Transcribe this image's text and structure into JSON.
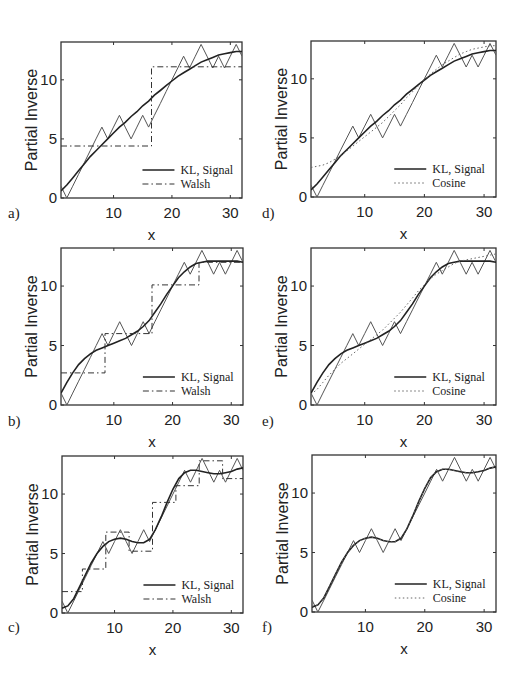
{
  "figure": {
    "y_axis_label": "Partial Inverse",
    "x_axis_label": "x",
    "x_ticks": [
      10,
      20,
      30
    ],
    "y_ticks": [
      0,
      5,
      10
    ]
  },
  "chart_data": [
    {
      "panel": "a)",
      "type": "line",
      "xlabel": "x",
      "ylabel": "Partial Inverse",
      "xlim": [
        1,
        32
      ],
      "ylim": [
        0,
        13.2
      ],
      "legend_position": "lower right",
      "legend": [
        "KL, Signal",
        "Walsh"
      ],
      "x": [
        1,
        2,
        3,
        4,
        5,
        6,
        7,
        8,
        9,
        10,
        11,
        12,
        13,
        14,
        15,
        16,
        17,
        18,
        19,
        20,
        21,
        22,
        23,
        24,
        25,
        26,
        27,
        28,
        29,
        30,
        31,
        32
      ],
      "series": [
        {
          "name": "Signal",
          "style": "solid-thin",
          "values": [
            1,
            0,
            1,
            2,
            3,
            4,
            5,
            6,
            5,
            6,
            7,
            6,
            5,
            6,
            7,
            6,
            7,
            8,
            9,
            10,
            11,
            12,
            11,
            12,
            13,
            12,
            11,
            12,
            11,
            12,
            13,
            12
          ]
        },
        {
          "name": "KL",
          "style": "solid",
          "values": [
            0.6,
            1.1,
            1.7,
            2.3,
            2.9,
            3.5,
            4.0,
            4.5,
            5.0,
            5.5,
            6.0,
            6.4,
            6.9,
            7.3,
            7.8,
            8.2,
            8.7,
            9.1,
            9.5,
            9.9,
            10.3,
            10.6,
            10.9,
            11.2,
            11.5,
            11.7,
            11.9,
            12.1,
            12.2,
            12.3,
            12.4,
            12.4
          ]
        },
        {
          "name": "Walsh",
          "style": "dashdot",
          "steps": [
            {
              "x0": 1,
              "x1": 16.5,
              "y": 4.4
            },
            {
              "x0": 16.5,
              "x1": 32,
              "y": 11.1
            }
          ]
        }
      ]
    },
    {
      "panel": "b)",
      "type": "line",
      "xlabel": "x",
      "ylabel": "Partial Inverse",
      "xlim": [
        1,
        32
      ],
      "ylim": [
        0,
        13.2
      ],
      "legend_position": "lower right",
      "legend": [
        "KL, Signal",
        "Walsh"
      ],
      "x": [
        1,
        2,
        3,
        4,
        5,
        6,
        7,
        8,
        9,
        10,
        11,
        12,
        13,
        14,
        15,
        16,
        17,
        18,
        19,
        20,
        21,
        22,
        23,
        24,
        25,
        26,
        27,
        28,
        29,
        30,
        31,
        32
      ],
      "series": [
        {
          "name": "Signal",
          "style": "solid-thin",
          "values": [
            1,
            0,
            1,
            2,
            3,
            4,
            5,
            6,
            5,
            6,
            7,
            6,
            5,
            6,
            7,
            6,
            7,
            8,
            9,
            10,
            11,
            12,
            11,
            12,
            13,
            12,
            11,
            12,
            11,
            12,
            13,
            12
          ]
        },
        {
          "name": "KL",
          "style": "solid",
          "values": [
            1.0,
            1.9,
            2.7,
            3.4,
            3.9,
            4.3,
            4.6,
            4.8,
            5.0,
            5.2,
            5.4,
            5.6,
            5.9,
            6.2,
            6.6,
            7.1,
            7.8,
            8.5,
            9.3,
            10.0,
            10.7,
            11.2,
            11.6,
            11.9,
            12.0,
            12.1,
            12.1,
            12.1,
            12.1,
            12.1,
            12.1,
            12.0
          ]
        },
        {
          "name": "Walsh",
          "style": "dashdot",
          "steps": [
            {
              "x0": 1,
              "x1": 8.5,
              "y": 2.7
            },
            {
              "x0": 8.5,
              "x1": 16.5,
              "y": 6.0
            },
            {
              "x0": 16.5,
              "x1": 24.5,
              "y": 10.1
            },
            {
              "x0": 24.5,
              "x1": 32,
              "y": 12.0
            }
          ]
        }
      ]
    },
    {
      "panel": "c)",
      "type": "line",
      "xlabel": "x",
      "ylabel": "Partial Inverse",
      "xlim": [
        1,
        32
      ],
      "ylim": [
        0,
        13.2
      ],
      "legend_position": "lower right",
      "legend": [
        "KL, Signal",
        "Walsh"
      ],
      "x": [
        1,
        2,
        3,
        4,
        5,
        6,
        7,
        8,
        9,
        10,
        11,
        12,
        13,
        14,
        15,
        16,
        17,
        18,
        19,
        20,
        21,
        22,
        23,
        24,
        25,
        26,
        27,
        28,
        29,
        30,
        31,
        32
      ],
      "series": [
        {
          "name": "Signal",
          "style": "solid-thin",
          "values": [
            1,
            0,
            1,
            2,
            3,
            4,
            5,
            6,
            5,
            6,
            7,
            6,
            5,
            6,
            7,
            6,
            7,
            8,
            9,
            10,
            11,
            12,
            11,
            12,
            13,
            12,
            11,
            12,
            11,
            12,
            13,
            12
          ]
        },
        {
          "name": "KL",
          "style": "solid",
          "values": [
            0.4,
            0.6,
            1.2,
            2.2,
            3.2,
            4.2,
            5.0,
            5.6,
            6.0,
            6.2,
            6.3,
            6.2,
            6.0,
            5.9,
            5.9,
            6.2,
            7.0,
            8.1,
            9.3,
            10.4,
            11.3,
            11.8,
            12.0,
            12.0,
            11.9,
            11.8,
            11.7,
            11.7,
            11.8,
            11.9,
            12.1,
            12.2
          ]
        },
        {
          "name": "Walsh",
          "style": "dashdot",
          "steps": [
            {
              "x0": 1,
              "x1": 4.5,
              "y": 1.8
            },
            {
              "x0": 4.5,
              "x1": 8.5,
              "y": 3.7
            },
            {
              "x0": 8.5,
              "x1": 12.5,
              "y": 6.8
            },
            {
              "x0": 12.5,
              "x1": 16.5,
              "y": 5.2
            },
            {
              "x0": 16.5,
              "x1": 20.5,
              "y": 9.3
            },
            {
              "x0": 20.5,
              "x1": 24.5,
              "y": 10.7
            },
            {
              "x0": 24.5,
              "x1": 28.5,
              "y": 12.8
            },
            {
              "x0": 28.5,
              "x1": 32,
              "y": 11.3
            }
          ]
        }
      ]
    },
    {
      "panel": "d)",
      "type": "line",
      "xlabel": "x",
      "ylabel": "Partial Inverse",
      "xlim": [
        1,
        32
      ],
      "ylim": [
        0,
        13.2
      ],
      "legend_position": "lower right",
      "legend": [
        "KL, Signal",
        "Cosine"
      ],
      "x": [
        1,
        2,
        3,
        4,
        5,
        6,
        7,
        8,
        9,
        10,
        11,
        12,
        13,
        14,
        15,
        16,
        17,
        18,
        19,
        20,
        21,
        22,
        23,
        24,
        25,
        26,
        27,
        28,
        29,
        30,
        31,
        32
      ],
      "series": [
        {
          "name": "Signal",
          "style": "solid-thin",
          "values": [
            1,
            0,
            1,
            2,
            3,
            4,
            5,
            6,
            5,
            6,
            7,
            6,
            5,
            6,
            7,
            6,
            7,
            8,
            9,
            10,
            11,
            12,
            11,
            12,
            13,
            12,
            11,
            12,
            11,
            12,
            13,
            12
          ]
        },
        {
          "name": "KL",
          "style": "solid",
          "values": [
            0.6,
            1.1,
            1.7,
            2.3,
            2.9,
            3.5,
            4.0,
            4.5,
            5.0,
            5.5,
            6.0,
            6.4,
            6.9,
            7.3,
            7.8,
            8.2,
            8.7,
            9.1,
            9.5,
            9.9,
            10.3,
            10.6,
            10.9,
            11.2,
            11.5,
            11.7,
            11.9,
            12.1,
            12.2,
            12.3,
            12.4,
            12.4
          ]
        },
        {
          "name": "Cosine",
          "style": "dotted",
          "values": [
            2.5,
            2.6,
            2.7,
            2.9,
            3.2,
            3.5,
            3.9,
            4.3,
            4.7,
            5.1,
            5.5,
            5.9,
            6.3,
            6.8,
            7.3,
            7.8,
            8.4,
            8.9,
            9.4,
            9.9,
            10.4,
            10.8,
            11.2,
            11.5,
            11.8,
            12.1,
            12.3,
            12.5,
            12.6,
            12.7,
            12.8,
            12.8
          ]
        }
      ]
    },
    {
      "panel": "e)",
      "type": "line",
      "xlabel": "x",
      "ylabel": "Partial Inverse",
      "xlim": [
        1,
        32
      ],
      "ylim": [
        0,
        13.2
      ],
      "legend_position": "lower right",
      "legend": [
        "KL, Signal",
        "Cosine"
      ],
      "x": [
        1,
        2,
        3,
        4,
        5,
        6,
        7,
        8,
        9,
        10,
        11,
        12,
        13,
        14,
        15,
        16,
        17,
        18,
        19,
        20,
        21,
        22,
        23,
        24,
        25,
        26,
        27,
        28,
        29,
        30,
        31,
        32
      ],
      "series": [
        {
          "name": "Signal",
          "style": "solid-thin",
          "values": [
            1,
            0,
            1,
            2,
            3,
            4,
            5,
            6,
            5,
            6,
            7,
            6,
            5,
            6,
            7,
            6,
            7,
            8,
            9,
            10,
            11,
            12,
            11,
            12,
            13,
            12,
            11,
            12,
            11,
            12,
            13,
            12
          ]
        },
        {
          "name": "KL",
          "style": "solid",
          "values": [
            1.0,
            1.9,
            2.7,
            3.4,
            3.9,
            4.3,
            4.6,
            4.8,
            5.0,
            5.2,
            5.4,
            5.6,
            5.9,
            6.2,
            6.6,
            7.1,
            7.8,
            8.5,
            9.3,
            10.0,
            10.7,
            11.2,
            11.6,
            11.9,
            12.0,
            12.1,
            12.1,
            12.1,
            12.1,
            12.1,
            12.1,
            12.0
          ]
        },
        {
          "name": "Cosine",
          "style": "dotted",
          "values": [
            0.9,
            1.3,
            1.9,
            2.5,
            3.0,
            3.5,
            3.9,
            4.3,
            4.7,
            5.1,
            5.5,
            5.9,
            6.3,
            6.8,
            7.3,
            7.8,
            8.4,
            9.0,
            9.6,
            10.1,
            10.6,
            11.0,
            11.3,
            11.6,
            11.9,
            12.1,
            12.2,
            12.3,
            12.4,
            12.5,
            12.6,
            12.7
          ]
        }
      ]
    },
    {
      "panel": "f)",
      "type": "line",
      "xlabel": "x",
      "ylabel": "Partial Inverse",
      "xlim": [
        1,
        32
      ],
      "ylim": [
        0,
        13.2
      ],
      "legend_position": "lower right",
      "legend": [
        "KL, Signal",
        "Cosine"
      ],
      "x": [
        1,
        2,
        3,
        4,
        5,
        6,
        7,
        8,
        9,
        10,
        11,
        12,
        13,
        14,
        15,
        16,
        17,
        18,
        19,
        20,
        21,
        22,
        23,
        24,
        25,
        26,
        27,
        28,
        29,
        30,
        31,
        32
      ],
      "series": [
        {
          "name": "Signal",
          "style": "solid-thin",
          "values": [
            1,
            0,
            1,
            2,
            3,
            4,
            5,
            6,
            5,
            6,
            7,
            6,
            5,
            6,
            7,
            6,
            7,
            8,
            9,
            10,
            11,
            12,
            11,
            12,
            13,
            12,
            11,
            12,
            11,
            12,
            13,
            12
          ]
        },
        {
          "name": "KL",
          "style": "solid",
          "values": [
            0.4,
            0.6,
            1.2,
            2.2,
            3.2,
            4.2,
            5.0,
            5.6,
            6.0,
            6.2,
            6.3,
            6.2,
            6.0,
            5.9,
            5.9,
            6.2,
            7.0,
            8.1,
            9.3,
            10.4,
            11.3,
            11.8,
            12.0,
            12.0,
            11.9,
            11.8,
            11.7,
            11.7,
            11.8,
            11.9,
            12.1,
            12.2
          ]
        },
        {
          "name": "Cosine",
          "style": "dotted",
          "values": [
            0.5,
            0.6,
            1.2,
            2.2,
            3.2,
            4.2,
            5.0,
            5.6,
            6.0,
            6.2,
            6.3,
            6.2,
            6.0,
            5.9,
            5.9,
            6.2,
            7.0,
            8.1,
            9.3,
            10.4,
            11.3,
            11.8,
            12.0,
            12.0,
            11.9,
            11.8,
            11.7,
            11.7,
            11.8,
            11.9,
            12.1,
            12.2
          ]
        }
      ]
    }
  ]
}
